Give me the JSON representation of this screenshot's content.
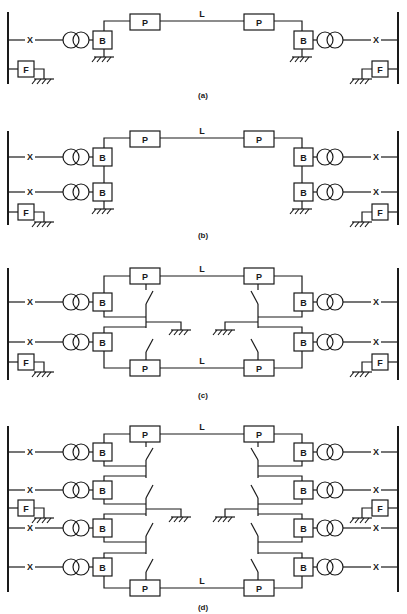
{
  "figure": {
    "colors": {
      "line": "#1a1a1a",
      "background": "#ffffff"
    },
    "symbols": {
      "breaker": "X",
      "filter": "F",
      "bridge": "B",
      "pole": "P",
      "line": "L",
      "transformer": "two-winding-transformer-icon",
      "ground": "ground-icon",
      "switch": "disconnect-switch-icon"
    },
    "panels": [
      {
        "id": "a",
        "caption": "(a)",
        "bridges_per_side": 1,
        "poles": 1,
        "lines": 1
      },
      {
        "id": "b",
        "caption": "(b)",
        "bridges_per_side": 2,
        "poles": 1,
        "lines": 1
      },
      {
        "id": "c",
        "caption": "(c)",
        "bridges_per_side": 2,
        "poles": 2,
        "lines": 2
      },
      {
        "id": "d",
        "caption": "(d)",
        "bridges_per_side": 4,
        "poles": 2,
        "lines": 2
      }
    ]
  }
}
